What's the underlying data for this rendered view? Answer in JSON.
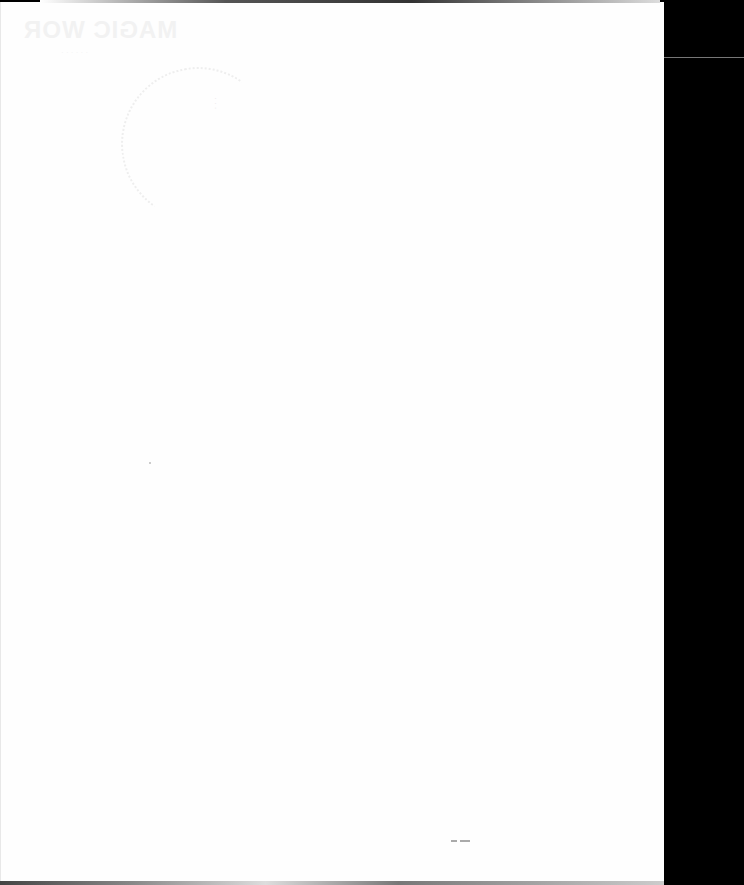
{
  "document": {
    "type": "scanned blank page",
    "bleed_through_heading": "MAGIC WOR",
    "bleed_through_subtext": "· · · · · ·",
    "stamp_text": "· · ·",
    "bottom_mark": "~ ~"
  },
  "colors": {
    "page": "#fefefe",
    "background": "#000000",
    "bleed": "#f2f2f2"
  }
}
